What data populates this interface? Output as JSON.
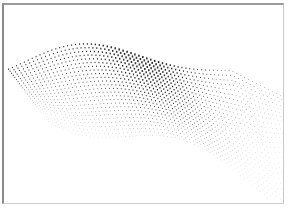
{
  "artwork": {
    "subject": "abstract halftone dot wave surface",
    "frame_color": "#9a9a9a",
    "background": "#ffffff",
    "dot_color": "#333333",
    "grid": {
      "columns": 70,
      "rows": 26
    },
    "wave": {
      "left_x": 8,
      "right_x": 280,
      "top_edge": [
        [
          8,
          88
        ],
        [
          60,
          60
        ],
        [
          100,
          52
        ],
        [
          140,
          68
        ],
        [
          180,
          48
        ],
        [
          230,
          58
        ],
        [
          280,
          92
        ]
      ],
      "bottom_edge": [
        [
          60,
          130
        ],
        [
          120,
          150
        ],
        [
          150,
          160
        ],
        [
          200,
          180
        ],
        [
          240,
          195
        ],
        [
          275,
          175
        ]
      ]
    }
  }
}
